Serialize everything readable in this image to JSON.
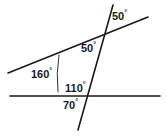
{
  "figure": {
    "kind": "geometry-diagram",
    "background_color": "#ffffff",
    "stroke_color": "#1a1a1a",
    "text_color": "#1a1a1a",
    "degree_symbol": "°",
    "labels": {
      "top_50": "50",
      "middle_50": "50",
      "left_160": "160",
      "inner_110": "110",
      "below_70": "70"
    },
    "lines": [
      {
        "name": "horizontal-baseline",
        "x1": 10,
        "y1": 96,
        "x2": 160,
        "y2": 96
      },
      {
        "name": "upper-slanted-line",
        "x1": 8,
        "y1": 73,
        "x2": 148,
        "y2": 17
      },
      {
        "name": "transversal-line",
        "x1": 113,
        "y1": 5,
        "x2": 78,
        "y2": 130
      }
    ],
    "arc_marker": {
      "name": "vertical-angle-arc",
      "x1": 59,
      "y1": 55,
      "x2": 58,
      "y2": 92
    },
    "intersections": [
      {
        "name": "upper-intersection",
        "x": 105,
        "y": 32
      },
      {
        "name": "lower-intersection",
        "x": 88,
        "y": 96
      }
    ]
  },
  "chart_data": {
    "type": "diagram",
    "title": "",
    "angles": [
      {
        "label": "50",
        "unit": "degrees",
        "value": 50,
        "position": "above-right of upper intersection"
      },
      {
        "label": "50",
        "unit": "degrees",
        "value": 50,
        "position": "left of upper intersection, between upper line and transversal"
      },
      {
        "label": "160",
        "unit": "degrees",
        "value": 160,
        "position": "left region between upper line and arc"
      },
      {
        "label": "110",
        "unit": "degrees",
        "value": 110,
        "position": "above baseline, left of transversal"
      },
      {
        "label": "70",
        "unit": "degrees",
        "value": 70,
        "position": "below baseline, left of transversal"
      }
    ]
  }
}
